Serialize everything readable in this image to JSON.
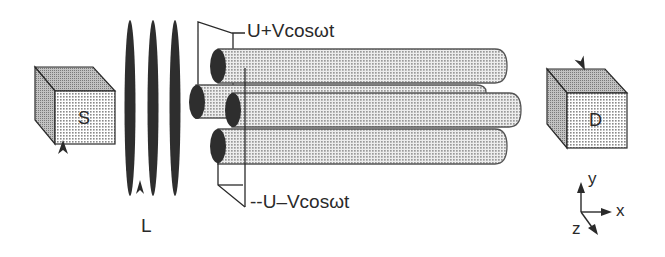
{
  "diagram": {
    "type": "quadrupole mass filter schematic",
    "source": {
      "label": "S"
    },
    "lens": {
      "label": "L"
    },
    "detector": {
      "label": "D"
    },
    "voltages": {
      "positive_pair": "U+Vcosωt",
      "negative_pair": "--U–Vcosωt"
    },
    "axes": {
      "x": "x",
      "y": "y",
      "z": "z"
    },
    "colors": {
      "ink": "#2a2a2a",
      "rod_fill": "#d4d4d4",
      "cube_front": "#dcdcdc",
      "cube_side": "#a8a8a8",
      "cube_top": "#b8b8b8",
      "lens_fill": "#2e2e2e"
    }
  }
}
